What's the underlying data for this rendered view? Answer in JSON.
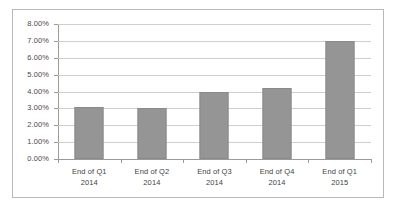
{
  "chart_data": {
    "type": "bar",
    "title": "",
    "xlabel": "",
    "ylabel": "",
    "categories": [
      "End of Q1 2014",
      "End of Q2 2014",
      "End of Q3 2014",
      "End of Q4 2014",
      "End of Q1 2015"
    ],
    "category_lines": [
      [
        "End of Q1",
        "2014"
      ],
      [
        "End of Q2",
        "2014"
      ],
      [
        "End of Q3",
        "2014"
      ],
      [
        "End of Q4",
        "2014"
      ],
      [
        "End of Q1",
        "2015"
      ]
    ],
    "values": [
      3.1,
      3.0,
      3.95,
      4.2,
      7.0
    ],
    "ylim": [
      0,
      8
    ],
    "ytick_values": [
      8,
      7,
      6,
      5,
      4,
      3,
      2,
      1,
      0
    ],
    "ytick_labels": [
      "8.00%",
      "7.00%",
      "6.00%",
      "5.00%",
      "4.00%",
      "3.00%",
      "2.00%",
      "1.00%",
      "0.00%"
    ],
    "grid": true,
    "legend": false,
    "bar_color": "#959595",
    "gridline_color": "#cfcfcf",
    "axis_color": "#9a9a9a",
    "plot_background": "#ffffff",
    "border_color": "#b9b9b9"
  }
}
